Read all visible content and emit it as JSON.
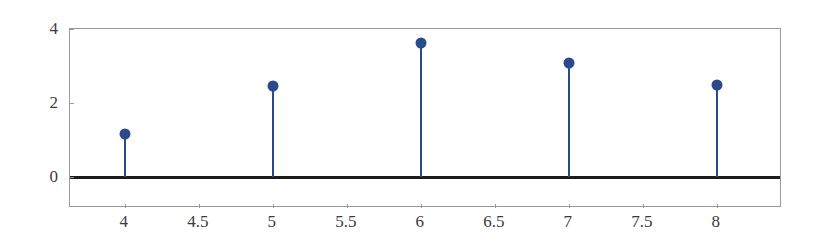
{
  "chart_data": {
    "type": "scatter",
    "plot_style": "stem",
    "title": "",
    "subtitle": "",
    "xlabel": "",
    "ylabel": "",
    "x": [
      4,
      5,
      6,
      7,
      8
    ],
    "values": [
      1.16,
      2.46,
      3.62,
      3.08,
      2.49
    ],
    "series": [
      {
        "name": "stem-series",
        "x": [
          4,
          5,
          6,
          7,
          8
        ],
        "values": [
          1.16,
          2.46,
          3.62,
          3.08,
          2.49
        ],
        "color": "#2b4a8b",
        "marker": "circle"
      }
    ],
    "xlim": [
      3.63,
      8.44
    ],
    "ylim": [
      -0.84,
      4.0
    ],
    "xticks": [
      4,
      4.5,
      5,
      5.5,
      6,
      6.5,
      7,
      7.5,
      8
    ],
    "xticklabels": [
      "4",
      "4.5",
      "5",
      "5.5",
      "6",
      "6.5",
      "7",
      "7.5",
      "8"
    ],
    "yticks": [
      0,
      2,
      4
    ],
    "yticklabels": [
      "0",
      "2",
      "4"
    ],
    "grid": false,
    "legend": null,
    "legend_position": "none",
    "baseline_value": 0,
    "baseline_color": "#1c1c1c",
    "frame_color": "#9a9a9a",
    "background_color": "#ffffff",
    "annotations": []
  }
}
